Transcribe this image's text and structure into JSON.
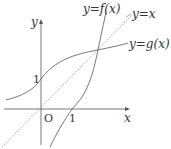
{
  "diagram": {
    "axes": {
      "x_label": "x",
      "y_label": "y",
      "origin_label": "O",
      "x_tick_label": "1",
      "y_tick_label": "1"
    },
    "curves": [
      {
        "name": "f",
        "label": "y=f(x)"
      },
      {
        "name": "identity",
        "label": "y=x",
        "style": "dotted"
      },
      {
        "name": "g",
        "label": "y=g(x)"
      }
    ],
    "colors": {
      "axis": "#555555",
      "curve": "#666666",
      "dotted": "#888888",
      "text": "#333333"
    }
  }
}
